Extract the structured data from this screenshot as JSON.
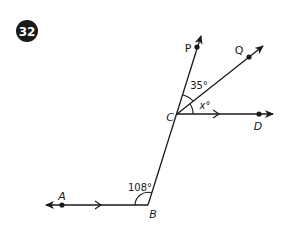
{
  "problem": {
    "number": "32",
    "badge_color": "#1a1a1a",
    "badge_text_color": "#ffffff"
  },
  "diagram": {
    "line_color": "#1a1a1a",
    "points": {
      "A": {
        "label": "A"
      },
      "B": {
        "label": "B"
      },
      "C": {
        "label": "C"
      },
      "D": {
        "label": "D"
      },
      "P": {
        "label": "P"
      },
      "Q": {
        "label": "Q"
      }
    },
    "angles": {
      "ABC": {
        "label": "108°"
      },
      "PCQ": {
        "label": "35°"
      },
      "QCD": {
        "label": "x°"
      }
    },
    "parallel_lines": [
      "AB",
      "CD"
    ]
  }
}
